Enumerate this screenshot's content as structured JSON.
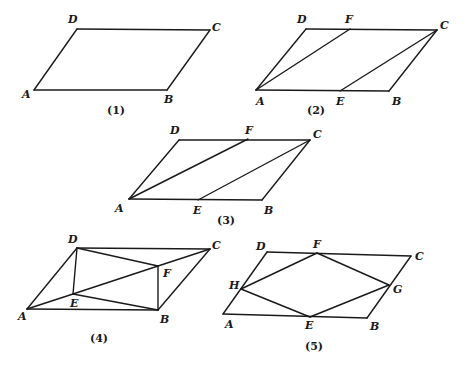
{
  "figures": [
    {
      "caption": "(1)",
      "caption_pos": [
        107,
        114
      ],
      "points": {
        "A": [
          34,
          90
        ],
        "B": [
          167,
          90
        ],
        "C": [
          210,
          30
        ],
        "D": [
          77,
          29
        ]
      },
      "segments": [
        [
          "A",
          "B"
        ],
        [
          "B",
          "C"
        ],
        [
          "C",
          "D"
        ],
        [
          "D",
          "A"
        ]
      ],
      "labels": [
        {
          "text": "D",
          "x": 68,
          "y": 23
        },
        {
          "text": "C",
          "x": 212,
          "y": 31
        },
        {
          "text": "A",
          "x": 22,
          "y": 98
        },
        {
          "text": "B",
          "x": 164,
          "y": 103
        }
      ]
    },
    {
      "caption": "(2)",
      "caption_pos": [
        307,
        114
      ],
      "points": {
        "A": [
          256,
          90
        ],
        "E": [
          340,
          91
        ],
        "B": [
          389,
          91
        ],
        "C": [
          437,
          30
        ],
        "F": [
          350,
          29
        ],
        "D": [
          306,
          29
        ]
      },
      "segments": [
        [
          "A",
          "B"
        ],
        [
          "B",
          "C"
        ],
        [
          "C",
          "D"
        ],
        [
          "D",
          "A"
        ],
        [
          "A",
          "F"
        ],
        [
          "E",
          "C"
        ]
      ],
      "labels": [
        {
          "text": "D",
          "x": 297,
          "y": 23
        },
        {
          "text": "F",
          "x": 345,
          "y": 23
        },
        {
          "text": "C",
          "x": 440,
          "y": 29
        },
        {
          "text": "A",
          "x": 256,
          "y": 105
        },
        {
          "text": "E",
          "x": 336,
          "y": 105
        },
        {
          "text": "B",
          "x": 392,
          "y": 105
        }
      ]
    },
    {
      "caption": "(3)",
      "caption_pos": [
        217,
        224
      ],
      "points": {
        "A": [
          129,
          199
        ],
        "E": [
          198,
          200
        ],
        "B": [
          262,
          200
        ],
        "C": [
          310,
          140
        ],
        "F": [
          248,
          139
        ],
        "D": [
          179,
          140
        ]
      },
      "segments": [
        [
          "A",
          "B"
        ],
        [
          "B",
          "C"
        ],
        [
          "C",
          "D"
        ],
        [
          "D",
          "A"
        ],
        [
          "A",
          "F"
        ],
        [
          "E",
          "C"
        ]
      ],
      "labels": [
        {
          "text": "D",
          "x": 170,
          "y": 134
        },
        {
          "text": "F",
          "x": 245,
          "y": 134
        },
        {
          "text": "C",
          "x": 313,
          "y": 138
        },
        {
          "text": "A",
          "x": 115,
          "y": 212
        },
        {
          "text": "E",
          "x": 193,
          "y": 214
        },
        {
          "text": "B",
          "x": 264,
          "y": 214
        }
      ]
    },
    {
      "caption": "(4)",
      "caption_pos": [
        90,
        342
      ],
      "points": {
        "A": [
          27,
          309
        ],
        "B": [
          158,
          310
        ],
        "C": [
          210,
          249
        ],
        "D": [
          77,
          248
        ],
        "E": [
          73,
          294
        ],
        "F": [
          158,
          266
        ]
      },
      "segments": [
        [
          "A",
          "B"
        ],
        [
          "B",
          "C"
        ],
        [
          "C",
          "D"
        ],
        [
          "D",
          "A"
        ],
        [
          "D",
          "E"
        ],
        [
          "D",
          "F"
        ],
        [
          "A",
          "E"
        ],
        [
          "E",
          "B"
        ],
        [
          "E",
          "F"
        ],
        [
          "F",
          "C"
        ],
        [
          "F",
          "B"
        ]
      ],
      "labels": [
        {
          "text": "D",
          "x": 68,
          "y": 243
        },
        {
          "text": "C",
          "x": 212,
          "y": 249
        },
        {
          "text": "F",
          "x": 163,
          "y": 277
        },
        {
          "text": "E",
          "x": 70,
          "y": 307
        },
        {
          "text": "A",
          "x": 18,
          "y": 320
        },
        {
          "text": "B",
          "x": 160,
          "y": 323
        }
      ]
    },
    {
      "caption": "(5)",
      "caption_pos": [
        305,
        350
      ],
      "points": {
        "A": [
          223,
          314
        ],
        "E": [
          310,
          317
        ],
        "B": [
          367,
          318
        ],
        "G": [
          389,
          285
        ],
        "C": [
          411,
          256
        ],
        "F": [
          317,
          253
        ],
        "D": [
          267,
          252
        ],
        "H": [
          241,
          289
        ]
      },
      "segments": [
        [
          "A",
          "B"
        ],
        [
          "B",
          "C"
        ],
        [
          "C",
          "D"
        ],
        [
          "D",
          "A"
        ],
        [
          "E",
          "G"
        ],
        [
          "G",
          "F"
        ],
        [
          "F",
          "H"
        ],
        [
          "H",
          "E"
        ]
      ],
      "labels": [
        {
          "text": "D",
          "x": 256,
          "y": 250
        },
        {
          "text": "F",
          "x": 313,
          "y": 248
        },
        {
          "text": "C",
          "x": 415,
          "y": 260
        },
        {
          "text": "H",
          "x": 229,
          "y": 289
        },
        {
          "text": "G",
          "x": 393,
          "y": 293
        },
        {
          "text": "A",
          "x": 225,
          "y": 328
        },
        {
          "text": "E",
          "x": 305,
          "y": 329
        },
        {
          "text": "B",
          "x": 370,
          "y": 330
        }
      ]
    }
  ]
}
